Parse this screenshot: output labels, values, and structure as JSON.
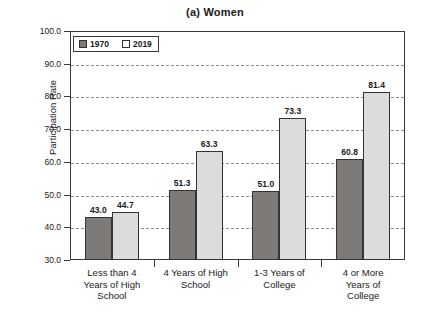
{
  "chart_data": {
    "type": "bar",
    "title": "(a) Women",
    "xlabel": "",
    "ylabel": "Participation Rate",
    "ylim": [
      30.0,
      100.0
    ],
    "ytick_step": 10.0,
    "ytick_labels": [
      "100.0",
      "90.0",
      "80.0",
      "70.0",
      "60.0",
      "50.0",
      "40.0",
      "30.0"
    ],
    "ytick_values": [
      100.0,
      90.0,
      80.0,
      70.0,
      60.0,
      50.0,
      40.0,
      30.0
    ],
    "grid": "horizontal-dashed",
    "legend_position": "top-left-inside",
    "categories": [
      "Less than 4 Years of High School",
      "4 Years of High School",
      "1-3 Years of College",
      "4 or More Years of College"
    ],
    "category_label_lines": [
      [
        "Less than 4",
        "Years of High",
        "School"
      ],
      [
        "4 Years of High",
        "School"
      ],
      [
        "1-3 Years of",
        "College"
      ],
      [
        "4 or More",
        "Years of",
        "College"
      ]
    ],
    "series": [
      {
        "name": "1970",
        "color": "#7d7a77",
        "values": [
          43.0,
          51.3,
          51.0,
          60.8
        ],
        "labels": [
          "43.0",
          "51.3",
          "51.0",
          "60.8"
        ]
      },
      {
        "name": "2019",
        "color": "#dcdcdc",
        "values": [
          44.7,
          63.3,
          73.3,
          81.4
        ],
        "labels": [
          "44.7",
          "63.3",
          "73.3",
          "81.4"
        ]
      }
    ]
  },
  "legend": {
    "entries": [
      {
        "label": "1970"
      },
      {
        "label": "2019"
      }
    ]
  }
}
